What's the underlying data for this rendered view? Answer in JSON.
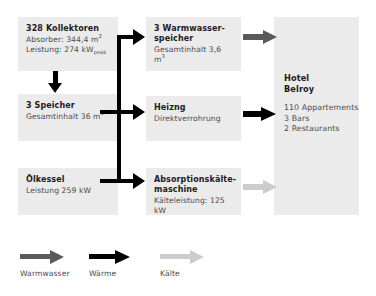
{
  "diagram": {
    "background": "#ffffff",
    "box_fill": "#ebebeb",
    "colors": {
      "warmwasser": "#5a5a5a",
      "waerme": "#000000",
      "kaelte": "#cccccc",
      "text_bold": "#1d1d1d",
      "text_regular": "#4a4a4a"
    }
  },
  "boxes": {
    "kollektoren": {
      "title": "328 Kollektoren",
      "line1_pre": "Absorber: 344,4 m",
      "line1_sup": "2",
      "line2_pre": "Leistung: 274 kW",
      "line2_sub": "peak"
    },
    "speicher": {
      "title": "3 Speicher",
      "line1_pre": "Gesamtinhalt 36 m",
      "line1_sup": "3"
    },
    "oelkessel": {
      "title": "Ölkessel",
      "line1": "Leistung 259 kW"
    },
    "warmwasserspeicher": {
      "title_line1": "3 Warmwasser-",
      "title_line2": "speicher",
      "line1_pre": "Gesamtinhalt 3,6 m",
      "line1_sup": "3"
    },
    "heizng": {
      "title": "Heizng",
      "line1": "Direktverrohrung"
    },
    "absorptionskaeltemaschine": {
      "title_line1": "Absorptionskälte-",
      "title_line2": "maschine",
      "line1": "Kälteleistung: 125 kW"
    },
    "hotel": {
      "title_line1": "Hotel",
      "title_line2": "Belroy",
      "item1": "110 Appartements",
      "item2": "3 Bars",
      "item3": "2 Restaurants"
    }
  },
  "legend": {
    "items": [
      {
        "label": "Warmwasser",
        "color": "#5a5a5a"
      },
      {
        "label": "Wärme",
        "color": "#000000"
      },
      {
        "label": "Kälte",
        "color": "#cccccc"
      }
    ]
  }
}
